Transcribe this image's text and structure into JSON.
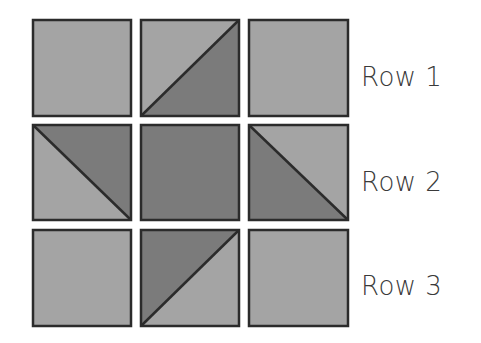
{
  "diagram": {
    "colors": {
      "light": "#a4a4a4",
      "dark": "#7b7b7b",
      "stroke": "#2b2b2b",
      "text": "#3a3a3a"
    },
    "grid": {
      "columns_x": [
        33,
        141,
        249
      ],
      "rows_y": [
        20,
        125,
        230
      ],
      "cell_size": 98
    },
    "rows": [
      {
        "label": "Row 1",
        "cells": [
          {
            "type": "solid",
            "fill": "light"
          },
          {
            "type": "diagonal",
            "line": "bottom-left-to-top-right",
            "top_left": "light",
            "bottom_right": "dark"
          },
          {
            "type": "solid",
            "fill": "light"
          }
        ]
      },
      {
        "label": "Row 2",
        "cells": [
          {
            "type": "diagonal",
            "line": "top-left-to-bottom-right",
            "top_right": "dark",
            "bottom_left": "light"
          },
          {
            "type": "solid",
            "fill": "dark"
          },
          {
            "type": "diagonal",
            "line": "top-left-to-bottom-right",
            "top_right": "light",
            "bottom_left": "dark"
          }
        ]
      },
      {
        "label": "Row 3",
        "cells": [
          {
            "type": "solid",
            "fill": "light"
          },
          {
            "type": "diagonal",
            "line": "bottom-left-to-top-right",
            "top_left": "dark",
            "bottom_right": "light"
          },
          {
            "type": "solid",
            "fill": "light"
          }
        ]
      }
    ]
  }
}
